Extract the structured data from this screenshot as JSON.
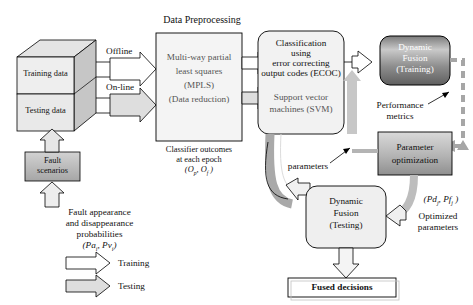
{
  "diagram": {
    "title_preprocessing": "Data Preprocessing",
    "data_cube": {
      "training": "Training data",
      "testing": "Testing data"
    },
    "fault_box": {
      "line1": "Fault",
      "line2": "scenarios"
    },
    "fault_caption": {
      "line1": "Fault appearance",
      "line2": "and disappearance",
      "line3": "probabilities",
      "line4_prefix": "(Pa",
      "line4_sub1": "i",
      "line4_mid": ", Pv",
      "line4_sub2": "i",
      "line4_suffix": ")"
    },
    "arrow_labels": {
      "offline": "Offline",
      "online": "On-line"
    },
    "preprocessing_box": {
      "line1": "Multi-way partial",
      "line2": "least squares",
      "line3": "(MPLS)",
      "line4": "(Data reduction)"
    },
    "classifier_outcomes": {
      "line1": "Classifier outcomes",
      "line2": "at each epoch",
      "line3_prefix": "(O",
      "line3_sub1": "p",
      "line3_mid": ", O",
      "line3_sub2": "f",
      "line3_suffix": " )"
    },
    "classification_box": {
      "line1": "Classification",
      "line2": "using",
      "line3": "error correcting",
      "line4": "output codes (ECOC)",
      "line5": "Support vector",
      "line6": "machines (SVM)"
    },
    "dynamic_fusion_training": {
      "line1": "Dynamic",
      "line2": "Fusion",
      "line3": "(Training)"
    },
    "dynamic_fusion_testing": {
      "line1": "Dynamic",
      "line2": "Fusion",
      "line3": "(Testing)"
    },
    "performance_metrics": {
      "line1": "Performance",
      "line2": "metrics"
    },
    "parameter_optimization": {
      "line1": "Parameter",
      "line2": "optimization"
    },
    "parameters_label": "parameters",
    "optimized": {
      "formula_prefix": "(Pd",
      "formula_sub1": "j",
      "formula_mid": ", Pf",
      "formula_sub2": "j",
      "formula_suffix": " )",
      "line1": "Optimized",
      "line2": "parameters"
    },
    "fused_decisions": "Fused decisions",
    "legend": {
      "training": "Training",
      "testing": "Testing"
    },
    "colors": {
      "outline": "#000000",
      "box_fill_light": "#efefef",
      "cube_side": "#c9c9c9",
      "cube_top": "#e2e2e2",
      "gray_arrow": "#b0b0b0",
      "dashed_feedback": "#9a9a9a",
      "gradient_dark": "#6a6a6a"
    }
  }
}
